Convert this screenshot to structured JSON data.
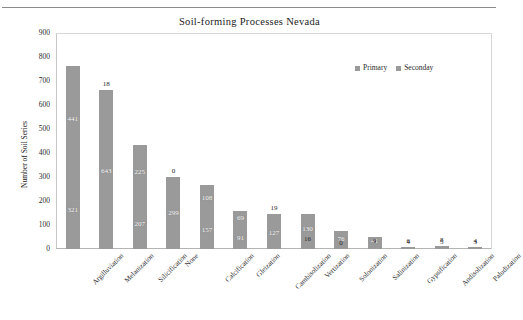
{
  "chart_data": {
    "type": "bar",
    "subtype": "stacked-bar",
    "title": "Soil-forming  Processes Nevada",
    "xlabel": "",
    "ylabel": "Number of Soil Series",
    "ylim": [
      0,
      900
    ],
    "ytick_step": 100,
    "yticks": [
      "900",
      "800",
      "700",
      "600",
      "500",
      "400",
      "300",
      "200",
      "100",
      "0"
    ],
    "grid": false,
    "legend_position": "top-right",
    "categories": [
      "Argilluviation",
      "Melanization",
      "Silicification",
      "None",
      "Calcification",
      "Gleization",
      "Cambisolization",
      "Vertization",
      "Solonization",
      "Salinization",
      "Gypsification",
      "Andisolization",
      "Paludization"
    ],
    "series": [
      {
        "name": "Primary",
        "color": "#9a9a9a",
        "values": [
          321,
          643,
          207,
          299,
          157,
          91,
          127,
          16,
          0,
          9,
          4,
          5,
          3
        ]
      },
      {
        "name": "Seconday",
        "color": "#9a9a9a",
        "values": [
          441,
          18,
          225,
          0,
          108,
          69,
          19,
          130,
          76,
          41,
          6,
          8,
          4
        ]
      }
    ],
    "bar_color": "#9a9a9a",
    "labels_shown": true
  },
  "legend": {
    "items": [
      {
        "label": "Primary",
        "color": "#9a9a9a"
      },
      {
        "label": "Seconday",
        "color": "#9a9a9a"
      }
    ]
  }
}
